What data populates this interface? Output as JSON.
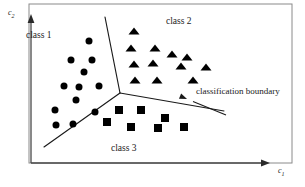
{
  "figure": {
    "kind": "classification-boundary-diagram",
    "width": 305,
    "height": 187,
    "background": "#ffffff",
    "ink_color": "#1a1a1a",
    "frame": {
      "left": 29,
      "top": 4,
      "right": 292,
      "bottom": 163
    }
  },
  "axes": {
    "x": {
      "label": "c",
      "subscript": "1",
      "x1": 31,
      "y1": 163,
      "x2": 268,
      "y2": 163
    },
    "y": {
      "label": "c",
      "subscript": "2",
      "x1": 31,
      "y1": 163,
      "x2": 31,
      "y2": 16
    }
  },
  "labels": {
    "class1": "class 1",
    "class2": "class 2",
    "class3": "class 3",
    "annotation": "classification boundary"
  },
  "annotation_arrow": {
    "x1": 226,
    "y1": 115,
    "x2": 187,
    "y2": 99
  },
  "boundary": {
    "junction": {
      "x": 120,
      "y": 93
    },
    "branches": [
      {
        "name": "upper-branch",
        "to": {
          "x": 105,
          "y": 17
        }
      },
      {
        "name": "lower-left-branch",
        "to": {
          "x": 44,
          "y": 147
        }
      },
      {
        "name": "right-branch",
        "to": {
          "x": 224,
          "y": 111
        }
      }
    ]
  },
  "chart_data": {
    "type": "scatter",
    "title": "",
    "xlabel": "c1",
    "ylabel": "c2",
    "grid": false,
    "legend": "none",
    "series": [
      {
        "name": "class 1",
        "marker": "circle",
        "color": "#000000",
        "size": 7,
        "points": [
          [
            89,
            41
          ],
          [
            71,
            60
          ],
          [
            92,
            60
          ],
          [
            64,
            86
          ],
          [
            79,
            87
          ],
          [
            99,
            86
          ],
          [
            76,
            100
          ],
          [
            55,
            110
          ],
          [
            56,
            125
          ],
          [
            73,
            124
          ],
          [
            95,
            112
          ],
          [
            84,
            72
          ]
        ]
      },
      {
        "name": "class 2",
        "marker": "triangle",
        "color": "#000000",
        "size": 11,
        "points": [
          [
            134,
            31
          ],
          [
            131,
            48
          ],
          [
            155,
            48
          ],
          [
            172,
            54
          ],
          [
            187,
            57
          ],
          [
            134,
            64
          ],
          [
            153,
            63
          ],
          [
            181,
            66
          ],
          [
            206,
            67
          ],
          [
            135,
            80
          ],
          [
            157,
            80
          ],
          [
            193,
            80
          ]
        ]
      },
      {
        "name": "class 3",
        "marker": "square",
        "color": "#000000",
        "size": 8,
        "points": [
          [
            119,
            110
          ],
          [
            141,
            110
          ],
          [
            165,
            118
          ],
          [
            107,
            122
          ],
          [
            131,
            127
          ],
          [
            158,
            128
          ],
          [
            184,
            127
          ]
        ]
      }
    ]
  }
}
